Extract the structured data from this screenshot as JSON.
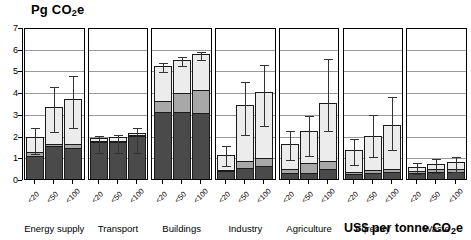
{
  "chart_data": {
    "type": "bar",
    "subtype": "stacked-bar-with-error-bars",
    "title": "",
    "ylabel": "Pg CO2e",
    "ylabel_rich": "Pg CO₂e",
    "xlabel": "US$ per tonne CO2e",
    "xlabel_rich": "US$ per tonne CO₂e",
    "ylim": [
      0,
      7
    ],
    "yticks": [
      0,
      1,
      2,
      3,
      4,
      5,
      6,
      7
    ],
    "ytick_labels": [
      "0",
      "1",
      "2",
      "3",
      "4",
      "5",
      "6",
      "7"
    ],
    "grid": true,
    "grid_axis": "y",
    "legend": "none",
    "categories": [
      "<20",
      "<50",
      "<100"
    ],
    "panels": [
      "Energy supply",
      "Transport",
      "Buildings",
      "Industry",
      "Agriculture",
      "Forestry",
      "Waste"
    ],
    "stack_names": [
      "low",
      "mid",
      "high"
    ],
    "stack_colors": {
      "low": "#4a4a4a",
      "mid": "#a8a8a8",
      "high": "#ececec"
    },
    "panel_data": [
      {
        "name": "Energy supply",
        "bars": [
          {
            "category": "<20",
            "low": 1.05,
            "mid": 0.18,
            "high": 0.72,
            "total": 1.95,
            "err_low": 1.25,
            "err_high": 2.45
          },
          {
            "category": "<50",
            "low": 1.5,
            "mid": 0.13,
            "high": 1.7,
            "total": 3.33,
            "err_low": 2.25,
            "err_high": 4.35
          },
          {
            "category": "<100",
            "low": 1.42,
            "mid": 0.17,
            "high": 2.08,
            "total": 3.67,
            "err_low": 2.45,
            "err_high": 4.85
          }
        ]
      },
      {
        "name": "Transport",
        "bars": [
          {
            "category": "<20",
            "low": 1.7,
            "mid": 0.04,
            "high": 0.16,
            "total": 1.9,
            "err_low": 1.3,
            "err_high": 2.05
          },
          {
            "category": "<50",
            "low": 1.72,
            "mid": 0.04,
            "high": 0.16,
            "total": 1.92,
            "err_low": 1.28,
            "err_high": 2.12
          },
          {
            "category": "<100",
            "low": 1.98,
            "mid": 0.04,
            "high": 0.08,
            "total": 2.1,
            "err_low": 1.3,
            "err_high": 2.45
          }
        ]
      },
      {
        "name": "Buildings",
        "bars": [
          {
            "category": "<20",
            "low": 3.1,
            "mid": 0.5,
            "high": 1.6,
            "total": 5.2,
            "err_low": 5.0,
            "err_high": 5.45
          },
          {
            "category": "<50",
            "low": 3.1,
            "mid": 0.88,
            "high": 1.52,
            "total": 5.5,
            "err_low": 5.3,
            "err_high": 5.72
          },
          {
            "category": "<100",
            "low": 3.05,
            "mid": 1.05,
            "high": 1.65,
            "total": 5.75,
            "err_low": 5.58,
            "err_high": 5.92
          }
        ]
      },
      {
        "name": "Industry",
        "bars": [
          {
            "category": "<20",
            "low": 0.36,
            "mid": 0.06,
            "high": 0.68,
            "total": 1.1,
            "err_low": 0.7,
            "err_high": 1.6
          },
          {
            "category": "<50",
            "low": 0.52,
            "mid": 0.3,
            "high": 2.58,
            "total": 3.4,
            "err_low": 2.1,
            "err_high": 4.55
          },
          {
            "category": "<100",
            "low": 0.6,
            "mid": 0.38,
            "high": 3.02,
            "total": 4.0,
            "err_low": 2.55,
            "err_high": 5.35
          }
        ]
      },
      {
        "name": "Agriculture",
        "bars": [
          {
            "category": "<20",
            "low": 0.3,
            "mid": 0.14,
            "high": 1.16,
            "total": 1.6,
            "err_low": 0.95,
            "err_high": 2.3
          },
          {
            "category": "<50",
            "low": 0.3,
            "mid": 0.42,
            "high": 1.48,
            "total": 2.2,
            "err_low": 1.15,
            "err_high": 3.0
          },
          {
            "category": "<100",
            "low": 0.48,
            "mid": 0.36,
            "high": 2.66,
            "total": 3.5,
            "err_low": 2.3,
            "err_high": 5.6
          }
        ]
      },
      {
        "name": "Forestry",
        "bars": [
          {
            "category": "<20",
            "low": 0.22,
            "mid": 0.1,
            "high": 1.03,
            "total": 1.35,
            "err_low": 0.75,
            "err_high": 1.95
          },
          {
            "category": "<50",
            "low": 0.3,
            "mid": 0.1,
            "high": 1.6,
            "total": 2.0,
            "err_low": 1.1,
            "err_high": 3.05
          },
          {
            "category": "<100",
            "low": 0.34,
            "mid": 0.12,
            "high": 2.04,
            "total": 2.5,
            "err_low": 1.45,
            "err_high": 3.85
          }
        ]
      },
      {
        "name": "Waste",
        "bars": [
          {
            "category": "<20",
            "low": 0.28,
            "mid": 0.1,
            "high": 0.17,
            "total": 0.55,
            "err_low": 0.3,
            "err_high": 0.85
          },
          {
            "category": "<50",
            "low": 0.32,
            "mid": 0.12,
            "high": 0.26,
            "total": 0.7,
            "err_low": 0.36,
            "err_high": 1.02
          },
          {
            "category": "<100",
            "low": 0.32,
            "mid": 0.12,
            "high": 0.36,
            "total": 0.8,
            "err_low": 0.4,
            "err_high": 1.1
          }
        ]
      }
    ]
  },
  "axis": {
    "y_title_main": "Pg CO",
    "y_title_sub": "2",
    "y_title_tail": "e",
    "x_title_main": "US$ per tonne CO",
    "x_title_sub": "2",
    "x_title_tail": "e"
  }
}
